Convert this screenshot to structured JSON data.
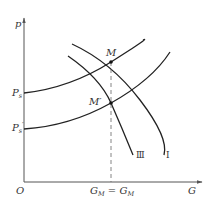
{
  "diagram": {
    "axes": {
      "y_label": "p",
      "x_label": "G",
      "origin_label": "O"
    },
    "y_ticks": [
      {
        "label_main": "P",
        "label_sub": "s",
        "prime": ""
      },
      {
        "label_main": "P",
        "label_sub": "s",
        "prime": "′"
      }
    ],
    "points": [
      {
        "label": "M"
      },
      {
        "label": "M′"
      }
    ],
    "x_annotation": {
      "left_main": "G",
      "left_sub": "M",
      "equals": " = ",
      "right_main": "G",
      "right_sub": "M"
    },
    "curve_labels": {
      "curve_3": "Ⅲ",
      "curve_1": "Ⅰ"
    },
    "colors": {
      "curve": "#222222",
      "axis": "#555555",
      "dash": "#666666"
    }
  }
}
